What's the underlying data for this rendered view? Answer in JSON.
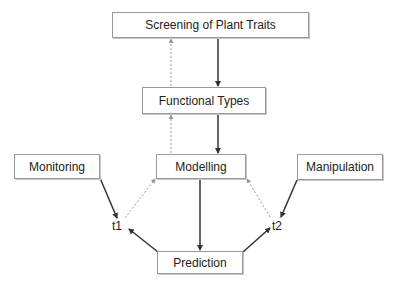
{
  "diagram": {
    "nodes": {
      "screening": {
        "label": "Screening of Plant Traits"
      },
      "functional_types": {
        "label": "Functional Types"
      },
      "monitoring": {
        "label": "Monitoring"
      },
      "modelling": {
        "label": "Modelling"
      },
      "manipulation": {
        "label": "Manipulation"
      },
      "prediction": {
        "label": "Prediction"
      },
      "t1": {
        "label": "t1"
      },
      "t2": {
        "label": "t2"
      }
    },
    "edges": [
      {
        "from": "screening",
        "to": "functional_types",
        "style": "solid"
      },
      {
        "from": "functional_types",
        "to": "screening",
        "style": "dotted"
      },
      {
        "from": "functional_types",
        "to": "modelling",
        "style": "solid"
      },
      {
        "from": "modelling",
        "to": "functional_types",
        "style": "dotted"
      },
      {
        "from": "modelling",
        "to": "prediction",
        "style": "solid"
      },
      {
        "from": "monitoring",
        "to": "t1",
        "style": "solid"
      },
      {
        "from": "t1",
        "to": "modelling",
        "style": "dotted"
      },
      {
        "from": "prediction",
        "to": "t1",
        "style": "solid"
      },
      {
        "from": "manipulation",
        "to": "t2",
        "style": "solid"
      },
      {
        "from": "t2",
        "to": "modelling",
        "style": "dotted"
      },
      {
        "from": "prediction",
        "to": "t2",
        "style": "solid"
      }
    ],
    "colors": {
      "solid_edge": "#333333",
      "dotted_edge": "#999999",
      "box_border": "#9a9a9a"
    }
  }
}
